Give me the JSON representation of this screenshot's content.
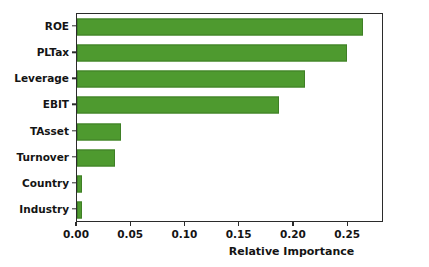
{
  "chart_data": {
    "type": "bar",
    "orientation": "horizontal",
    "title": "",
    "xlabel": "Relative Importance",
    "ylabel": "",
    "categories": [
      "ROE",
      "PLTax",
      "Leverage",
      "EBIT",
      "TAsset",
      "Turnover",
      "Country",
      "Industry"
    ],
    "values": [
      0.264,
      0.249,
      0.21,
      0.186,
      0.041,
      0.035,
      0.005,
      0.005
    ],
    "xlim": [
      0.0,
      0.283
    ],
    "xticks": [
      0.0,
      0.05,
      0.1,
      0.15,
      0.2,
      0.25
    ],
    "xtick_labels": [
      "0.00",
      "0.05",
      "0.10",
      "0.15",
      "0.20",
      "0.25"
    ],
    "grid": false,
    "legend": null,
    "bar_color": "#4e9a2f",
    "bar_edge_color": "#3f7f26",
    "axes_color": "#2b2b2b",
    "background": "#ffffff"
  }
}
